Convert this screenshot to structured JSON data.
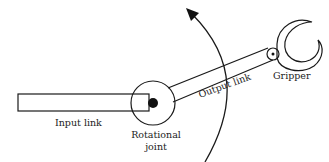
{
  "diagram": {
    "labels": {
      "input_link": "Input link",
      "output_link": "Output link",
      "rotational": "Rotational",
      "joint": "joint",
      "gripper": "Gripper"
    },
    "icons": {
      "rotation_arrow": "curved-arrow",
      "joint": "circle-with-dot",
      "gripper": "crescent-claw"
    },
    "colors": {
      "line": "#1a1a1a",
      "background": "#ffffff",
      "text": "#222222"
    }
  }
}
